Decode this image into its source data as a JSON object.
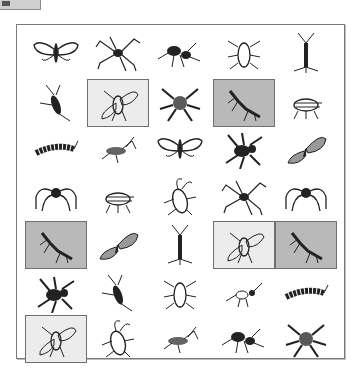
{
  "task": "image-selection-grid",
  "grid": {
    "columns": 5,
    "rows": 7,
    "colors": {
      "frame_border": "#7a7a7a",
      "selected_light": "#ececec",
      "selected_dark": "#b9b9b9",
      "ink": "#222222"
    },
    "cells": [
      {
        "row": 0,
        "col": 0,
        "icon": "moth-icon",
        "state": "none"
      },
      {
        "row": 0,
        "col": 1,
        "icon": "harvestman-spider-icon",
        "state": "none"
      },
      {
        "row": 0,
        "col": 2,
        "icon": "ant-icon",
        "state": "none"
      },
      {
        "row": 0,
        "col": 3,
        "icon": "beetle-icon",
        "state": "none"
      },
      {
        "row": 0,
        "col": 4,
        "icon": "silverfish-icon",
        "state": "none"
      },
      {
        "row": 1,
        "col": 0,
        "icon": "cricket-icon",
        "state": "none"
      },
      {
        "row": 1,
        "col": 1,
        "icon": "fly-icon",
        "state": "selected-light"
      },
      {
        "row": 1,
        "col": 2,
        "icon": "hairy-spider-icon",
        "state": "none"
      },
      {
        "row": 1,
        "col": 3,
        "icon": "mantis-icon",
        "state": "selected-dark"
      },
      {
        "row": 1,
        "col": 4,
        "icon": "cicada-icon",
        "state": "none"
      },
      {
        "row": 2,
        "col": 0,
        "icon": "caterpillar-icon",
        "state": "none"
      },
      {
        "row": 2,
        "col": 1,
        "icon": "grasshopper-icon",
        "state": "none"
      },
      {
        "row": 2,
        "col": 2,
        "icon": "moth-icon",
        "state": "none"
      },
      {
        "row": 2,
        "col": 3,
        "icon": "black-spider-icon",
        "state": "none"
      },
      {
        "row": 2,
        "col": 4,
        "icon": "butterfly-icon",
        "state": "none"
      },
      {
        "row": 3,
        "col": 0,
        "icon": "long-leg-spider-icon",
        "state": "none"
      },
      {
        "row": 3,
        "col": 1,
        "icon": "cicada-icon",
        "state": "none"
      },
      {
        "row": 3,
        "col": 2,
        "icon": "cockroach-icon",
        "state": "none"
      },
      {
        "row": 3,
        "col": 3,
        "icon": "harvestman-spider-icon",
        "state": "none"
      },
      {
        "row": 3,
        "col": 4,
        "icon": "long-leg-spider-icon",
        "state": "none"
      },
      {
        "row": 4,
        "col": 0,
        "icon": "mantis-icon",
        "state": "selected-dark"
      },
      {
        "row": 4,
        "col": 1,
        "icon": "butterfly-icon",
        "state": "none"
      },
      {
        "row": 4,
        "col": 2,
        "icon": "silverfish-icon",
        "state": "none"
      },
      {
        "row": 4,
        "col": 3,
        "icon": "fly-icon",
        "state": "selected-light"
      },
      {
        "row": 4,
        "col": 4,
        "icon": "mantis-icon",
        "state": "selected-dark"
      },
      {
        "row": 5,
        "col": 0,
        "icon": "black-spider-icon",
        "state": "none"
      },
      {
        "row": 5,
        "col": 1,
        "icon": "cricket-icon",
        "state": "none"
      },
      {
        "row": 5,
        "col": 2,
        "icon": "beetle-icon",
        "state": "none"
      },
      {
        "row": 5,
        "col": 3,
        "icon": "ant-small-icon",
        "state": "none"
      },
      {
        "row": 5,
        "col": 4,
        "icon": "caterpillar-icon",
        "state": "none"
      },
      {
        "row": 6,
        "col": 0,
        "icon": "fly-icon",
        "state": "selected-light"
      },
      {
        "row": 6,
        "col": 1,
        "icon": "cockroach-icon",
        "state": "none"
      },
      {
        "row": 6,
        "col": 2,
        "icon": "grasshopper-icon",
        "state": "none"
      },
      {
        "row": 6,
        "col": 3,
        "icon": "ant-icon",
        "state": "none"
      },
      {
        "row": 6,
        "col": 4,
        "icon": "hairy-spider-icon",
        "state": "none"
      }
    ]
  }
}
